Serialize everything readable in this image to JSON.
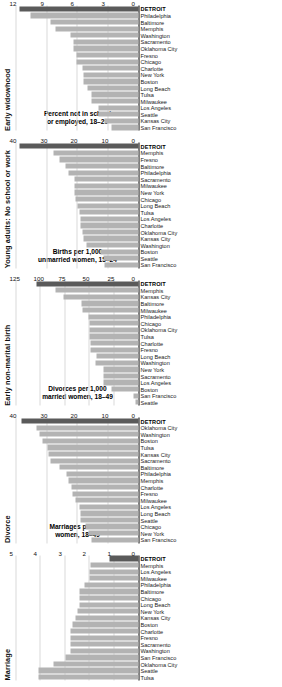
{
  "figure": {
    "accent_bar_color": "#b3b3b3",
    "highlight_bar_color": "#5a5a5a",
    "highlight_city": "DETROIT"
  },
  "chart_data": [
    {
      "type": "bar",
      "title": "Marriage",
      "xlabel": "",
      "ylabel": "Marriages per 100\nwomen, 18–49",
      "ylim": [
        0,
        5
      ],
      "ticks": [
        "0",
        "1",
        "2",
        "3",
        "4",
        "5"
      ],
      "grid": true,
      "categories": [
        "Tulsa",
        "Seattle",
        "Oklahoma City",
        "San Francisco",
        "Washington",
        "Sacramento",
        "Fresno",
        "Charlotte",
        "Boston",
        "Kansas City",
        "New York",
        "Long Beach",
        "Chicago",
        "Baltimore",
        "Philadelphia",
        "Milwaukee",
        "Los Angeles",
        "Memphis",
        "DETROIT"
      ],
      "values": [
        4.1,
        4.1,
        3.5,
        3.0,
        2.8,
        2.8,
        2.8,
        2.8,
        2.7,
        2.6,
        2.5,
        2.4,
        2.4,
        2.4,
        2.2,
        2.0,
        2.0,
        1.95,
        1.2
      ],
      "highlight": "DETROIT"
    },
    {
      "type": "bar",
      "title": "Divorce",
      "xlabel": "",
      "ylabel": "Divorces per 1,000\nmarried women, 18–49",
      "ylim": [
        0,
        40
      ],
      "ticks": [
        "0",
        "10",
        "20",
        "30",
        "40"
      ],
      "grid": true,
      "categories": [
        "San Francisco",
        "New York",
        "Chicago",
        "Seattle",
        "Long Beach",
        "Los Angeles",
        "Milwaukee",
        "Fresno",
        "Charlotte",
        "Memphis",
        "Philadelphia",
        "Baltimore",
        "Sacramento",
        "Kansas City",
        "Tulsa",
        "Boston",
        "Washington",
        "Oklahoma City",
        "DETROIT"
      ],
      "values": [
        15.5,
        16.5,
        17.5,
        19.0,
        19.0,
        19.5,
        20.5,
        21.5,
        22.0,
        23.0,
        23.5,
        26.0,
        29.0,
        29.5,
        30.0,
        31.5,
        32.5,
        33.5,
        38.5
      ],
      "highlight": "DETROIT"
    },
    {
      "type": "bar",
      "title": "Early non-marital birth",
      "xlabel": "",
      "ylabel": "Births per 1,000\nunmarried women, 15–24",
      "ylim": [
        0,
        125
      ],
      "ticks": [
        "0",
        "25",
        "50",
        "75",
        "100",
        "125"
      ],
      "grid": true,
      "categories": [
        "Seattle",
        "San Francisco",
        "Boston",
        "Los Angeles",
        "Sacramento",
        "New York",
        "Washington",
        "Long Beach",
        "Fresno",
        "Charlotte",
        "Tulsa",
        "Oklahoma City",
        "Chicago",
        "Philadelphia",
        "Milwaukee",
        "Baltimore",
        "Kansas City",
        "Memphis",
        "DETROIT"
      ],
      "values": [
        3,
        5,
        28,
        36,
        36,
        36,
        44,
        43,
        49,
        49,
        50,
        50,
        50,
        51,
        57,
        58,
        77,
        85,
        105
      ],
      "highlight": "DETROIT"
    },
    {
      "type": "bar",
      "title": "Young adults: No school or work",
      "xlabel": "",
      "ylabel": "Percent not in school\nor employed, 18–29",
      "ylim": [
        0,
        40
      ],
      "ticks": [
        "0",
        "10",
        "20",
        "30",
        "40"
      ],
      "grid": true,
      "categories": [
        "San Francisco",
        "Seattle",
        "Boston",
        "Washington",
        "Kansas City",
        "Oklahoma City",
        "Charlotte",
        "Los Angeles",
        "Tulsa",
        "Long Beach",
        "Chicago",
        "New York",
        "Milwaukee",
        "Sacramento",
        "Philadelphia",
        "Baltimore",
        "Fresno",
        "Memphis",
        "DETROIT"
      ],
      "values": [
        11.0,
        11.5,
        12.5,
        17.0,
        18.0,
        18.5,
        19.0,
        19.0,
        19.5,
        20.0,
        20.5,
        21.0,
        21.0,
        21.0,
        23.0,
        24.0,
        26.0,
        28.0,
        39.0
      ],
      "highlight": "DETROIT"
    },
    {
      "type": "bar",
      "title": "Early widowhood",
      "xlabel": "",
      "ylabel": "Widowhood per 1000\nmarried, 40–59",
      "ylim": [
        0,
        12
      ],
      "ticks": [
        "0",
        "3",
        "6",
        "9",
        "12"
      ],
      "grid": true,
      "categories": [
        "San Francisco",
        "Kansas City",
        "Seattle",
        "Los Angeles",
        "Milwaukee",
        "Tulsa",
        "Long Beach",
        "Boston",
        "New York",
        "Charlotte",
        "Chicago",
        "Fresno",
        "Oklahoma City",
        "Sacramento",
        "Washington",
        "Memphis",
        "Baltimore",
        "Philadelphia",
        "DETROIT"
      ],
      "values": [
        2.7,
        3.3,
        3.9,
        3.9,
        4.6,
        4.6,
        5.0,
        5.4,
        5.4,
        5.5,
        6.1,
        6.1,
        6.4,
        6.4,
        6.7,
        8.2,
        8.7,
        10.6,
        11.7
      ],
      "highlight": "DETROIT"
    }
  ]
}
